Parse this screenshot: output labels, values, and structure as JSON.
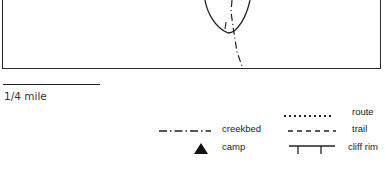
{
  "map": {
    "scale": {
      "label": "1/4 mile"
    },
    "legend": {
      "items": [
        {
          "symbol": "dotted-line",
          "label": "route"
        },
        {
          "symbol": "dashed-line",
          "label": "trail"
        },
        {
          "symbol": "cliff-rim-line",
          "label": "cliff rim"
        },
        {
          "symbol": "dash-dot-line",
          "label": "creekbed"
        },
        {
          "symbol": "triangle-icon",
          "label": "camp"
        }
      ]
    }
  }
}
